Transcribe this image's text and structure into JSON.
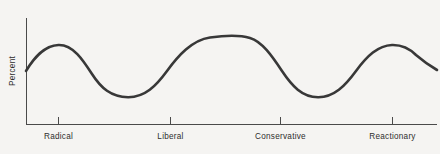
{
  "chart_data": {
    "type": "line",
    "title": "",
    "xlabel": "",
    "ylabel": "Percent",
    "grid": false,
    "legend": false,
    "categories": [
      "Radical",
      "Liberal",
      "Conservative",
      "Reactionary"
    ],
    "tick_labels_x": [
      "Radical",
      "Liberal",
      "Conservative",
      "Reactionary"
    ],
    "tick_labels_y": [],
    "xlim": [
      0,
      100
    ],
    "ylim": [
      0,
      100
    ],
    "series": [
      {
        "name": "Distribution of political opinion",
        "x": [
          0,
          8,
          16,
          25,
          33,
          41,
          48,
          56,
          64,
          72,
          80,
          88,
          94,
          100
        ],
        "values": [
          51,
          68,
          76,
          66,
          44,
          29,
          28,
          45,
          72,
          85,
          76,
          50,
          30,
          30
        ]
      }
    ],
    "annotations": [],
    "line_color": "#383838",
    "line_width": 2.6,
    "background_color": "#f5f4f2",
    "axis_color": "#4a4a4a",
    "key_points": {
      "start_value": 51,
      "peak_1": {
        "category_near": "Radical",
        "value": 76
      },
      "valley_1": {
        "value": 28
      },
      "peak_2": {
        "value": 85
      },
      "valley_2": {
        "value": 28
      },
      "peak_3": {
        "category_near": "Reactionary",
        "value": 76
      },
      "end_value": 59
    }
  },
  "axis": {
    "y_title": "Percent",
    "x_tick_labels": [
      {
        "label": "Radical",
        "x": 58
      },
      {
        "label": "Liberal",
        "x": 170
      },
      {
        "label": "Conservative",
        "x": 280
      },
      {
        "label": "Reactionary",
        "x": 392
      }
    ]
  },
  "geometry": {
    "y_axis_x": 26,
    "x_axis_y": 124,
    "plot_right": 437,
    "plot_top": 18,
    "curve_path": "M 26,71 C 34,58 44,45.5 58.5,45 C 73,44.5 83,60 92,74 C 101,88 111,97 128,97.2 C 145,97.4 156,86 167,71 C 178,56 192,40 210,37.5 C 228,35 240,35 250,38 C 262,41.5 272,56 282,71 C 292,86 302,97 318,97.2 C 334,97.4 345,86 356,71 C 367,56 378,45.5 392,45 C 402,44.7 410,49 416,55 C 423,61 430,66 437,70"
  }
}
